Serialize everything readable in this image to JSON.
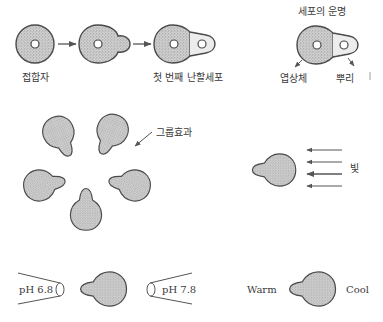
{
  "figure": {
    "colors": {
      "outline": "#4a4a4a",
      "stipple": "#bdbdbd",
      "background": "#ffffff",
      "text": "#3a3a3a"
    },
    "row1": {
      "stage1_label": "접합자",
      "stage2_label": "",
      "stage3_label": "첫 번째 난할세포",
      "fate_title": "세포의 운명",
      "fate_left_label": "엽상체",
      "fate_right_label": "뿌리"
    },
    "group_effect": {
      "label": "그룹효과",
      "cell_count": 5
    },
    "light": {
      "label": "빛",
      "arrow_count": 4
    },
    "ph": {
      "left_label": "pH 6.8",
      "right_label": "pH 7.8"
    },
    "temperature": {
      "left_label": "Warm",
      "right_label": "Cool"
    }
  }
}
